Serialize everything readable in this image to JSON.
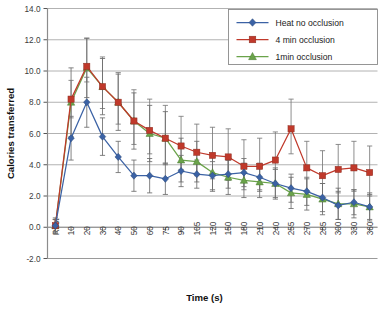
{
  "chart_data": {
    "type": "line",
    "title": "",
    "xlabel": "Time (s)",
    "ylabel": "Calories transferred",
    "grid": true,
    "legend_position": "top-right",
    "categories": [
      "Rest",
      "10",
      "20",
      "30",
      "40",
      "50",
      "60",
      "75",
      "90",
      "105",
      "120",
      "150",
      "180",
      "210",
      "240",
      "255",
      "270",
      "285",
      "300",
      "330",
      "360"
    ],
    "ylim": [
      -2.0,
      14.0
    ],
    "ytick_step": 2.0,
    "yticks": [
      "14.0",
      "12.0",
      "10.0",
      "8.0",
      "6.0",
      "4.0",
      "2.0",
      "0.0",
      "-2.0"
    ],
    "series": [
      {
        "name": "Heat no occlusion",
        "color": "#3b62a5",
        "marker": "diamond",
        "values": [
          0.1,
          5.7,
          8.0,
          5.8,
          4.5,
          3.3,
          3.3,
          3.1,
          3.6,
          3.4,
          3.3,
          3.4,
          3.5,
          3.2,
          2.8,
          2.5,
          2.3,
          1.9,
          1.4,
          1.6,
          1.3
        ],
        "err_up": [
          0.5,
          1.4,
          1.6,
          1.2,
          1.0,
          1.0,
          1.1,
          1.0,
          1.0,
          0.9,
          0.9,
          0.9,
          0.9,
          0.9,
          0.9,
          0.9,
          0.9,
          0.9,
          0.9,
          0.8,
          0.8
        ],
        "err_dn": [
          0.5,
          1.4,
          1.6,
          1.2,
          1.0,
          1.0,
          1.1,
          1.0,
          1.0,
          0.9,
          0.9,
          0.9,
          0.9,
          0.9,
          0.9,
          0.9,
          0.9,
          0.9,
          0.9,
          0.8,
          0.8
        ]
      },
      {
        "name": "4 min occlusion",
        "color": "#c0392b",
        "marker": "square",
        "values": [
          0.1,
          8.2,
          10.3,
          9.0,
          8.0,
          6.8,
          6.2,
          5.7,
          5.2,
          4.8,
          4.6,
          4.5,
          3.9,
          3.9,
          4.3,
          6.3,
          3.8,
          3.3,
          3.7,
          3.8,
          3.5
        ],
        "err_up": [
          0.4,
          1.2,
          1.8,
          1.9,
          1.9,
          2.0,
          2.0,
          2.1,
          1.9,
          1.8,
          1.8,
          1.8,
          1.7,
          1.8,
          1.8,
          1.9,
          1.7,
          1.6,
          1.6,
          1.7,
          1.7
        ],
        "err_dn": [
          0.4,
          1.2,
          1.0,
          1.4,
          1.4,
          1.5,
          1.5,
          1.6,
          1.5,
          1.5,
          1.5,
          1.5,
          1.5,
          1.5,
          1.5,
          1.6,
          1.5,
          1.4,
          1.5,
          1.5,
          1.5
        ]
      },
      {
        "name": "1min occlusion",
        "color": "#6aa34a",
        "marker": "triangle",
        "values": [
          0.1,
          8.0,
          10.2,
          9.0,
          8.0,
          6.8,
          6.0,
          5.7,
          4.3,
          4.2,
          3.5,
          3.2,
          3.0,
          2.9,
          2.8,
          2.2,
          2.1,
          1.8,
          1.5,
          1.5,
          1.3
        ],
        "err_up": [
          0.4,
          2.2,
          1.9,
          1.8,
          1.8,
          1.8,
          1.8,
          1.7,
          1.4,
          1.3,
          1.2,
          1.1,
          1.1,
          1.0,
          1.0,
          1.0,
          1.0,
          1.0,
          1.0,
          0.9,
          0.9
        ],
        "err_dn": [
          0.4,
          2.2,
          1.9,
          1.8,
          1.8,
          1.8,
          1.8,
          1.7,
          1.4,
          1.3,
          1.2,
          1.1,
          1.1,
          1.0,
          1.0,
          1.0,
          1.0,
          1.0,
          1.0,
          0.9,
          0.9
        ]
      }
    ]
  },
  "legend": {
    "entries": [
      {
        "label": "Heat no occlusion"
      },
      {
        "label": "4 min occlusion"
      },
      {
        "label": "1min occlusion"
      }
    ]
  }
}
